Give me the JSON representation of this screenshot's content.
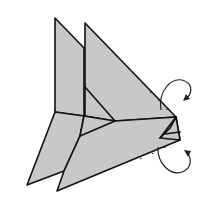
{
  "diagram": {
    "type": "origami-fold-step",
    "description": "Origami diagram step: folded paper model with two upright triangular flaps, two lower flaps, and two curved rotation arrows indicating folding the tip",
    "paper_color": "#c8c8c8",
    "line_color": "#111111",
    "background": "#ffffff",
    "arrows": [
      {
        "name": "upper-curved-arrow",
        "direction": "clockwise-over",
        "meaning": "fold top layer behind"
      },
      {
        "name": "lower-curved-arrow",
        "direction": "counter-clockwise-under",
        "meaning": "fold bottom layer behind"
      }
    ],
    "labels": []
  }
}
